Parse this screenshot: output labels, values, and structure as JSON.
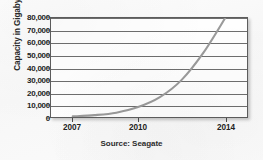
{
  "chart_data": {
    "type": "line",
    "title": "",
    "subtitle": "",
    "xlabel": "",
    "ylabel": "Capacity in Gigabytes",
    "source_note": "Source: Seagate",
    "grid": true,
    "legend": null,
    "xlim": [
      2006,
      2015
    ],
    "ylim": [
      0,
      80000
    ],
    "xticks": [
      2007,
      2010,
      2014
    ],
    "xticklabels": [
      "2007",
      "2010",
      "2014"
    ],
    "yticks": [
      0,
      10000,
      20000,
      30000,
      40000,
      50000,
      60000,
      70000,
      80000
    ],
    "yticklabels": [
      "0",
      "10,000",
      "20,000",
      "30,000",
      "40,000",
      "50,000",
      "60,000",
      "70,000",
      "80,000"
    ],
    "series": [
      {
        "name": "Hard drive capacity",
        "color": "#9a9a9a",
        "x": [
          2007,
          2008,
          2009,
          2010,
          2011,
          2012,
          2013,
          2014
        ],
        "values": [
          500,
          1500,
          3500,
          8000,
          16000,
          30000,
          52000,
          80000
        ]
      }
    ]
  },
  "labels": {
    "ylabel": "Capacity in Gigabytes",
    "source": "Source: Seagate"
  },
  "colors": {
    "curve": "#9a9a9a",
    "grid": "#6e6e6e",
    "frame": "#5d5d5d",
    "text": "#232323",
    "page": "#fbfbfb"
  }
}
